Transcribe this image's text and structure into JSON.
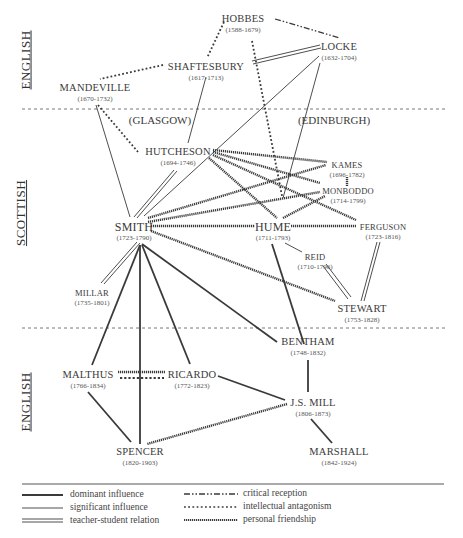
{
  "regions": [
    {
      "label": "ENGLISH",
      "id": "english-top"
    },
    {
      "label": "SCOTTISH",
      "id": "scottish"
    },
    {
      "label": "ENGLISH",
      "id": "english-bottom"
    }
  ],
  "cities": {
    "glasgow": "(GLASGOW)",
    "edinburgh": "(EDINBURGH)"
  },
  "nodes": {
    "hobbes": {
      "name": "HOBBES",
      "years": "(1588-1679)"
    },
    "locke": {
      "name": "LOCKE",
      "years": "(1632-1704)"
    },
    "shaftesbury": {
      "name": "SHAFTESBURY",
      "years": "(1617-1713)"
    },
    "mandeville": {
      "name": "MANDEVILLE",
      "years": "(1670-1732)"
    },
    "hutcheson": {
      "name": "HUTCHESON",
      "years": "(1694-1746)"
    },
    "kames": {
      "name": "KAMES",
      "years": "(1696-1782)"
    },
    "monboddo": {
      "name": "MONBODDO",
      "years": "(1714-1799)"
    },
    "smith": {
      "name": "SMITH",
      "years": "(1723-1790)"
    },
    "hume": {
      "name": "HUME",
      "years": "(1711-1793)"
    },
    "ferguson": {
      "name": "FERGUSON",
      "years": "(1723-1816)"
    },
    "reid": {
      "name": "REID",
      "years": "(1710-1796)"
    },
    "millar": {
      "name": "MILLAR",
      "years": "(1735-1801)"
    },
    "stewart": {
      "name": "STEWART",
      "years": "(1753-1828)"
    },
    "bentham": {
      "name": "BENTHAM",
      "years": "(1748-1832)"
    },
    "malthus": {
      "name": "MALTHUS",
      "years": "(1766-1834)"
    },
    "ricardo": {
      "name": "RICARDO",
      "years": "(1772-1823)"
    },
    "jsmill": {
      "name": "J.S. MILL",
      "years": "(1806-1873)"
    },
    "spencer": {
      "name": "SPENCER",
      "years": "(1820-1903)"
    },
    "marshall": {
      "name": "MARSHALL",
      "years": "(1842-1924)"
    }
  },
  "edges": [
    {
      "from": "hobbes",
      "to": "locke",
      "type": "critical reception"
    },
    {
      "from": "hobbes",
      "to": "shaftesbury",
      "type": "intellectual antagonism"
    },
    {
      "from": "hobbes",
      "to": "hume",
      "type": "intellectual antagonism"
    },
    {
      "from": "shaftesbury",
      "to": "mandeville",
      "type": "intellectual antagonism"
    },
    {
      "from": "locke",
      "to": "shaftesbury",
      "type": "teacher-student relation"
    },
    {
      "from": "shaftesbury",
      "to": "hutcheson",
      "type": "significant influence"
    },
    {
      "from": "locke",
      "to": "smith",
      "type": "significant influence"
    },
    {
      "from": "locke",
      "to": "hume",
      "type": "significant influence"
    },
    {
      "from": "mandeville",
      "to": "hutcheson",
      "type": "intellectual antagonism"
    },
    {
      "from": "mandeville",
      "to": "smith",
      "type": "significant influence"
    },
    {
      "from": "hutcheson",
      "to": "smith",
      "type": "teacher-student relation"
    },
    {
      "from": "hutcheson",
      "to": "kames",
      "type": "personal friendship"
    },
    {
      "from": "hutcheson",
      "to": "monboddo",
      "type": "personal friendship"
    },
    {
      "from": "hutcheson",
      "to": "ferguson",
      "type": "personal friendship"
    },
    {
      "from": "hutcheson",
      "to": "hume",
      "type": "personal friendship"
    },
    {
      "from": "smith",
      "to": "kames",
      "type": "personal friendship"
    },
    {
      "from": "smith",
      "to": "monboddo",
      "type": "personal friendship"
    },
    {
      "from": "smith",
      "to": "hume",
      "type": "personal friendship"
    },
    {
      "from": "smith",
      "to": "stewart",
      "type": "personal friendship"
    },
    {
      "from": "hume",
      "to": "monboddo",
      "type": "personal friendship"
    },
    {
      "from": "hume",
      "to": "ferguson",
      "type": "personal friendship"
    },
    {
      "from": "kames",
      "to": "monboddo",
      "type": "personal friendship"
    },
    {
      "from": "hume",
      "to": "reid",
      "type": "significant influence"
    },
    {
      "from": "reid",
      "to": "stewart",
      "type": "teacher-student relation"
    },
    {
      "from": "ferguson",
      "to": "stewart",
      "type": "teacher-student relation"
    },
    {
      "from": "smith",
      "to": "millar",
      "type": "teacher-student relation"
    },
    {
      "from": "hume",
      "to": "bentham",
      "type": "dominant influence"
    },
    {
      "from": "smith",
      "to": "bentham",
      "type": "dominant influence"
    },
    {
      "from": "smith",
      "to": "malthus",
      "type": "dominant influence"
    },
    {
      "from": "smith",
      "to": "ricardo",
      "type": "dominant influence"
    },
    {
      "from": "smith",
      "to": "spencer",
      "type": "dominant influence"
    },
    {
      "from": "malthus",
      "to": "ricardo",
      "type": "personal friendship"
    },
    {
      "from": "malthus",
      "to": "ricardo",
      "type": "intellectual antagonism"
    },
    {
      "from": "malthus",
      "to": "spencer",
      "type": "dominant influence"
    },
    {
      "from": "ricardo",
      "to": "jsmill",
      "type": "dominant influence"
    },
    {
      "from": "bentham",
      "to": "jsmill",
      "type": "dominant influence"
    },
    {
      "from": "jsmill",
      "to": "spencer",
      "type": "personal friendship"
    },
    {
      "from": "jsmill",
      "to": "marshall",
      "type": "dominant influence"
    }
  ],
  "legend": {
    "left": [
      {
        "style": "dominant",
        "label": "dominant influence"
      },
      {
        "style": "significant",
        "label": "significant influence"
      },
      {
        "style": "teacher",
        "label": "teacher-student relation"
      }
    ],
    "right": [
      {
        "style": "critical",
        "label": "critical reception"
      },
      {
        "style": "antagonism",
        "label": "intellectual antagonism"
      },
      {
        "style": "friendship",
        "label": "personal friendship"
      }
    ]
  },
  "colors": {
    "ink": "#3a3a3a",
    "divider": "#555555"
  }
}
